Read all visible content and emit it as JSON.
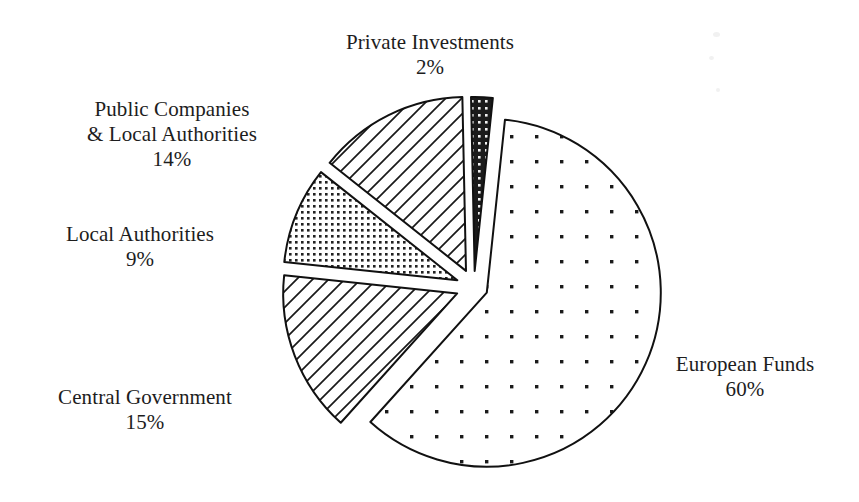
{
  "chart_data": {
    "type": "pie",
    "title": "",
    "subtitle": "",
    "xlabel": "",
    "ylabel": "",
    "legend_position": "none",
    "grid": false,
    "exploded": true,
    "units": "percent",
    "categories": [
      "European Funds",
      "Private Investments",
      "Public Companies & Local Authorities",
      "Local Authorities",
      "Central Government"
    ],
    "values": [
      60,
      2,
      14,
      9,
      15
    ],
    "slices": [
      {
        "id": "european-funds",
        "label_line1": "European Funds",
        "label_line2": "",
        "percent_text": "60%",
        "value": 60,
        "fill_pattern": "sparse-dots",
        "fill_color": "#ffffff",
        "stroke_color": "#111111",
        "start_angle_deg": -84,
        "sweep_deg": 216,
        "explode_px": 14
      },
      {
        "id": "central-government",
        "label_line1": "Central Government",
        "label_line2": "",
        "percent_text": "15%",
        "value": 15,
        "fill_pattern": "diagonal-hatch",
        "fill_color": "#ffffff",
        "stroke_color": "#111111",
        "start_angle_deg": 132,
        "sweep_deg": 54,
        "explode_px": 18
      },
      {
        "id": "local-authorities",
        "label_line1": "Local Authorities",
        "label_line2": "",
        "percent_text": "9%",
        "value": 9,
        "fill_pattern": "dense-dots",
        "fill_color": "#ffffff",
        "stroke_color": "#111111",
        "start_angle_deg": 186,
        "sweep_deg": 32.4,
        "explode_px": 18
      },
      {
        "id": "public-companies-local-authorities",
        "label_line1": "Public Companies",
        "label_line2": "& Local Authorities",
        "percent_text": "14%",
        "value": 14,
        "fill_pattern": "diagonal-hatch",
        "fill_color": "#ffffff",
        "stroke_color": "#111111",
        "start_angle_deg": 218.4,
        "sweep_deg": 50.4,
        "explode_px": 18
      },
      {
        "id": "private-investments",
        "label_line1": "Private Investments",
        "label_line2": "",
        "percent_text": "2%",
        "value": 2,
        "fill_pattern": "solid-dark-dots",
        "fill_color": "#1b1b1b",
        "stroke_color": "#111111",
        "start_angle_deg": 268.8,
        "sweep_deg": 7.2,
        "explode_px": 16
      }
    ],
    "colors": {
      "background": "#ffffff",
      "outline": "#111111",
      "dark_slice": "#1b1b1b",
      "text": "#1d1d1d"
    },
    "geometry": {
      "center_x": 474,
      "center_y": 287,
      "radius": 174
    }
  },
  "labels": {
    "private": {
      "line1": "Private Investments",
      "line2": "",
      "pct": "2%"
    },
    "public": {
      "line1": "Public Companies",
      "line2": "& Local Authorities",
      "pct": "14%"
    },
    "localauth": {
      "line1": "Local Authorities",
      "line2": "",
      "pct": "9%"
    },
    "central": {
      "line1": "Central Government",
      "line2": "",
      "pct": "15%"
    },
    "european": {
      "line1": "European Funds",
      "line2": "",
      "pct": "60%"
    }
  }
}
